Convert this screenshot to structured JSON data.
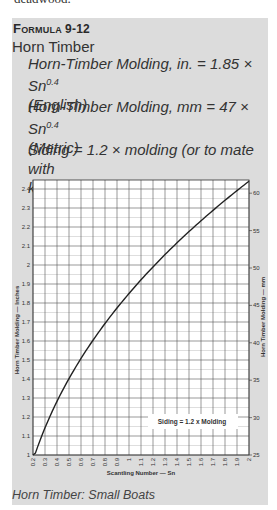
{
  "preceding_text_fragment": "deadwood.",
  "formula": {
    "label": "Formula",
    "number": "9-12",
    "title": "Horn Timber",
    "equations": [
      {
        "text": "Horn-Timber Molding, in. = 1.85 × Sn",
        "exponent": "0.4",
        "note": "(English)"
      },
      {
        "text": "Horn-Timber Molding, mm = 47 × Sn",
        "exponent": "0.4",
        "note": "(Metric)"
      },
      {
        "text": "Siding = 1.2 × molding (or to mate with",
        "exponent": "",
        "note": "keel)"
      }
    ]
  },
  "caption": "Horn Timber: Small Boats",
  "colors": {
    "box_bg": "#dcdcdc",
    "plot_bg": "#ffffff",
    "grid_major": "#555555",
    "grid_minor": "#c8c8c8",
    "curve": "#222222"
  },
  "chart_data": {
    "type": "line",
    "title": "Horn Timber: Small Boats",
    "xlabel": "Scantling Number — Sn",
    "ylabel": "Horn Timber Molding — Inches",
    "ylabel_right": "Horn Timber Molding — mm",
    "annotation": "Siding = 1.2 x Molding",
    "xlim": [
      0.2,
      2.0
    ],
    "ylim": [
      1.0,
      2.45
    ],
    "ylim_right": [
      25,
      62
    ],
    "grid": true,
    "x_ticks": [
      "0.2",
      "0.3",
      "0.4",
      "0.5",
      "0.6",
      "0.7",
      "0.8",
      "0.9",
      "1",
      "1.1",
      "1.2",
      "1.3",
      "1.4",
      "1.5",
      "1.6",
      "1.7",
      "1.8",
      "1.9",
      "2"
    ],
    "y_ticks": [
      "1",
      "1.1",
      "1.2",
      "1.3",
      "1.4",
      "1.5",
      "1.6",
      "1.7",
      "1.8",
      "1.9",
      "2",
      "2.1",
      "2.2",
      "2.3",
      "2.4"
    ],
    "y_ticks_right": [
      "25",
      "30",
      "35",
      "40",
      "45",
      "50",
      "55",
      "60"
    ],
    "series": [
      {
        "name": "Horn-Timber Molding (in.) = 1.85 × Sn^0.4",
        "x": [
          0.2,
          0.3,
          0.4,
          0.5,
          0.6,
          0.7,
          0.8,
          0.9,
          1.0,
          1.1,
          1.2,
          1.3,
          1.4,
          1.5,
          1.6,
          1.7,
          1.8,
          1.9,
          2.0
        ],
        "values": [
          1.0,
          1.14,
          1.28,
          1.4,
          1.51,
          1.61,
          1.69,
          1.77,
          1.85,
          1.92,
          1.99,
          2.06,
          2.12,
          2.18,
          2.24,
          2.29,
          2.35,
          2.4,
          2.44
        ]
      }
    ]
  }
}
